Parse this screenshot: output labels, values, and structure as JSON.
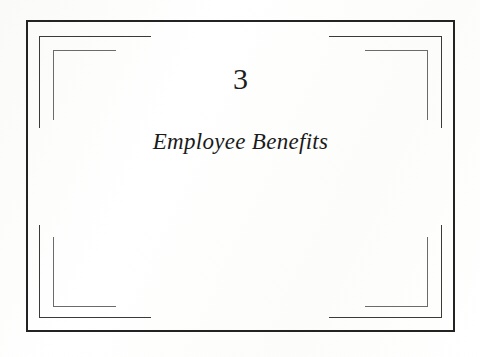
{
  "document": {
    "type": "book-chapter-title-page",
    "page_background": "#ffffff"
  },
  "chapter": {
    "number": "3",
    "title": "Employee Benefits"
  },
  "frame": {
    "outer_border_color": "#232323",
    "mid_bracket_color": "#3a3a3a",
    "inner_bracket_color": "#6b6b6b",
    "corners": [
      {
        "name": "top-left"
      },
      {
        "name": "top-right"
      },
      {
        "name": "bottom-left"
      },
      {
        "name": "bottom-right"
      }
    ]
  }
}
